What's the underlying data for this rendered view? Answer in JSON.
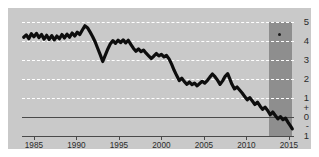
{
  "chart_data": {
    "type": "line",
    "title": "",
    "subtitle": "",
    "xlabel": "",
    "ylabel": "",
    "xlim": [
      1983.6,
      2015.6
    ],
    "ylim": [
      -1,
      5
    ],
    "grid": true,
    "grid_style": "dashed-white",
    "legend": "none",
    "x_ticks": [
      1985,
      1990,
      1995,
      2000,
      2005,
      2010,
      2015
    ],
    "x_tick_labels": [
      "1985",
      "1990",
      "1995",
      "2000",
      "2005",
      "2010",
      "2015"
    ],
    "y_ticks": [
      5,
      4,
      3,
      2,
      1,
      0.45,
      0,
      -0.45,
      -1
    ],
    "y_tick_labels": [
      "5",
      "4",
      "3",
      "2",
      "1",
      "+",
      "0",
      "-",
      "1"
    ],
    "gridline_values": [
      5,
      4,
      3,
      2,
      1
    ],
    "zero_line_value": 0,
    "zero_line_style": "solid-dark",
    "series": [
      {
        "name": "trend",
        "color": "#0d0d0d",
        "width": 3.2,
        "points": [
          [
            1983.8,
            4.2
          ],
          [
            1984.1,
            4.32
          ],
          [
            1984.4,
            4.12
          ],
          [
            1984.7,
            4.38
          ],
          [
            1985.0,
            4.22
          ],
          [
            1985.3,
            4.4
          ],
          [
            1985.6,
            4.18
          ],
          [
            1985.9,
            4.34
          ],
          [
            1986.2,
            4.1
          ],
          [
            1986.5,
            4.3
          ],
          [
            1986.8,
            4.08
          ],
          [
            1987.1,
            4.28
          ],
          [
            1987.4,
            4.06
          ],
          [
            1987.7,
            4.26
          ],
          [
            1988.0,
            4.12
          ],
          [
            1988.3,
            4.34
          ],
          [
            1988.6,
            4.16
          ],
          [
            1988.9,
            4.36
          ],
          [
            1989.2,
            4.2
          ],
          [
            1989.5,
            4.42
          ],
          [
            1989.8,
            4.26
          ],
          [
            1990.1,
            4.46
          ],
          [
            1990.4,
            4.34
          ],
          [
            1990.7,
            4.58
          ],
          [
            1991.0,
            4.8
          ],
          [
            1991.3,
            4.7
          ],
          [
            1991.6,
            4.48
          ],
          [
            1991.9,
            4.24
          ],
          [
            1992.2,
            3.96
          ],
          [
            1992.5,
            3.62
          ],
          [
            1992.8,
            3.28
          ],
          [
            1993.1,
            2.92
          ],
          [
            1993.4,
            3.26
          ],
          [
            1993.7,
            3.58
          ],
          [
            1994.0,
            3.86
          ],
          [
            1994.3,
            4.02
          ],
          [
            1994.6,
            3.88
          ],
          [
            1994.9,
            4.04
          ],
          [
            1995.2,
            3.92
          ],
          [
            1995.5,
            4.06
          ],
          [
            1995.8,
            3.9
          ],
          [
            1996.1,
            4.04
          ],
          [
            1996.4,
            3.82
          ],
          [
            1996.7,
            3.62
          ],
          [
            1997.0,
            3.46
          ],
          [
            1997.3,
            3.58
          ],
          [
            1997.6,
            3.44
          ],
          [
            1997.9,
            3.52
          ],
          [
            1998.2,
            3.36
          ],
          [
            1998.5,
            3.22
          ],
          [
            1998.8,
            3.08
          ],
          [
            1999.1,
            3.2
          ],
          [
            1999.4,
            3.34
          ],
          [
            1999.7,
            3.22
          ],
          [
            2000.0,
            3.3
          ],
          [
            2000.3,
            3.16
          ],
          [
            2000.6,
            3.24
          ],
          [
            2000.9,
            3.06
          ],
          [
            2001.2,
            2.78
          ],
          [
            2001.5,
            2.46
          ],
          [
            2001.8,
            2.18
          ],
          [
            2002.1,
            1.92
          ],
          [
            2002.4,
            2.04
          ],
          [
            2002.7,
            1.86
          ],
          [
            2003.0,
            1.72
          ],
          [
            2003.3,
            1.84
          ],
          [
            2003.6,
            1.7
          ],
          [
            2003.9,
            1.78
          ],
          [
            2004.2,
            1.64
          ],
          [
            2004.5,
            1.76
          ],
          [
            2004.8,
            1.88
          ],
          [
            2005.1,
            1.78
          ],
          [
            2005.4,
            1.92
          ],
          [
            2005.7,
            2.1
          ],
          [
            2006.0,
            2.26
          ],
          [
            2006.3,
            2.12
          ],
          [
            2006.6,
            1.94
          ],
          [
            2006.9,
            1.72
          ],
          [
            2007.2,
            1.9
          ],
          [
            2007.5,
            2.14
          ],
          [
            2007.8,
            2.28
          ],
          [
            2008.0,
            2.06
          ],
          [
            2008.3,
            1.72
          ],
          [
            2008.6,
            1.48
          ],
          [
            2008.9,
            1.58
          ],
          [
            2009.2,
            1.42
          ],
          [
            2009.5,
            1.26
          ],
          [
            2009.8,
            1.08
          ],
          [
            2010.1,
            0.9
          ],
          [
            2010.4,
            1.02
          ],
          [
            2010.7,
            0.84
          ],
          [
            2011.0,
            0.66
          ],
          [
            2011.3,
            0.78
          ],
          [
            2011.6,
            0.58
          ],
          [
            2011.9,
            0.4
          ],
          [
            2012.2,
            0.52
          ],
          [
            2012.5,
            0.34
          ],
          [
            2012.8,
            0.12
          ],
          [
            2013.1,
            0.26
          ],
          [
            2013.4,
            0.08
          ],
          [
            2013.7,
            -0.1
          ],
          [
            2014.0,
            0.02
          ],
          [
            2014.3,
            -0.14
          ],
          [
            2014.6,
            -0.06
          ],
          [
            2014.9,
            -0.28
          ],
          [
            2015.2,
            -0.48
          ],
          [
            2015.4,
            -0.62
          ]
        ]
      }
    ],
    "shaded_band": {
      "name": "forecast-band",
      "x_start": 2012.7,
      "x_end": 2015.35,
      "y_top": 5.0,
      "y_bottom": -1.0,
      "color": "#8e8e8e"
    },
    "marker": {
      "name": "band-dot",
      "x": 2013.9,
      "y": 4.33,
      "color": "#1a1a1a"
    },
    "colors": {
      "panel_background": "#c9c9c9",
      "figure_background": "#ffffff",
      "gridline": "#ffffff",
      "axis": "#4a4a4a",
      "line": "#0d0d0d",
      "band": "#8e8e8e",
      "tick_label": "#2b2b2b"
    }
  }
}
